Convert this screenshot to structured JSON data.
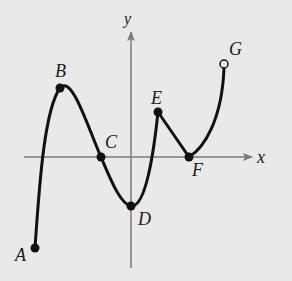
{
  "diagram": {
    "axes": {
      "x_label": "x",
      "y_label": "y",
      "axis_color": "#7a7a7a"
    },
    "curve_color": "#111111",
    "background": "#e9e9e9",
    "points": [
      {
        "label": "A",
        "x": 35,
        "y": 248,
        "style": "filled"
      },
      {
        "label": "B",
        "x": 60,
        "y": 88,
        "style": "filled"
      },
      {
        "label": "C",
        "x": 101,
        "y": 157,
        "style": "filled"
      },
      {
        "label": "D",
        "x": 131,
        "y": 206,
        "style": "filled"
      },
      {
        "label": "E",
        "x": 158,
        "y": 112,
        "style": "filled"
      },
      {
        "label": "F",
        "x": 189,
        "y": 157,
        "style": "filled"
      },
      {
        "label": "G",
        "x": 224,
        "y": 64,
        "style": "open"
      }
    ],
    "labels": {
      "A": "A",
      "B": "B",
      "C": "C",
      "D": "D",
      "E": "E",
      "F": "F",
      "G": "G"
    }
  }
}
